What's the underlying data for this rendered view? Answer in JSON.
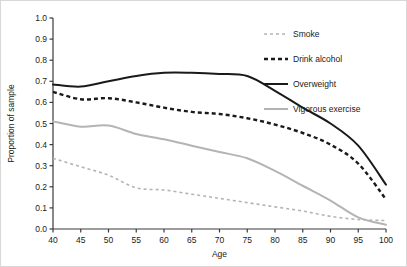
{
  "chart_data": {
    "type": "line",
    "title": "",
    "xlabel": "Age",
    "ylabel": "Proportion of sample",
    "xlim": [
      40,
      100
    ],
    "ylim": [
      0.0,
      1.0
    ],
    "grid": false,
    "legend_position": "right",
    "x": [
      40,
      45,
      50,
      55,
      60,
      65,
      70,
      75,
      80,
      85,
      90,
      95,
      100
    ],
    "xticks": [
      "40",
      "45",
      "50",
      "55",
      "60",
      "65",
      "70",
      "75",
      "80",
      "85",
      "90",
      "95",
      "100"
    ],
    "yticks": [
      "0.0",
      "0.1",
      "0.2",
      "0.3",
      "0.4",
      "0.5",
      "0.6",
      "0.7",
      "0.8",
      "0.9",
      "1.0"
    ],
    "series": [
      {
        "name": "Smoke",
        "color": "#b4b4b4",
        "style": "dashed",
        "width": 1.6,
        "values": [
          0.335,
          0.295,
          0.255,
          0.195,
          0.185,
          0.165,
          0.145,
          0.125,
          0.105,
          0.085,
          0.06,
          0.045,
          0.04
        ]
      },
      {
        "name": "Drink alcohol",
        "color": "#1a1a1a",
        "style": "dashed-bold",
        "width": 2.4,
        "values": [
          0.65,
          0.615,
          0.62,
          0.6,
          0.575,
          0.555,
          0.545,
          0.525,
          0.495,
          0.455,
          0.4,
          0.31,
          0.14
        ]
      },
      {
        "name": "Overweight",
        "color": "#1a1a1a",
        "style": "solid",
        "width": 2.0,
        "values": [
          0.685,
          0.675,
          0.7,
          0.725,
          0.74,
          0.74,
          0.735,
          0.725,
          0.655,
          0.575,
          0.5,
          0.395,
          0.21
        ]
      },
      {
        "name": "Vigorous exercise",
        "color": "#b4b4b4",
        "style": "solid",
        "width": 2.0,
        "values": [
          0.51,
          0.485,
          0.49,
          0.45,
          0.425,
          0.395,
          0.365,
          0.335,
          0.275,
          0.205,
          0.135,
          0.055,
          0.02
        ]
      }
    ]
  },
  "legend": {
    "items": [
      {
        "label": "Smoke"
      },
      {
        "label": "Drink alcohol"
      },
      {
        "label": "Overweight"
      },
      {
        "label": "Vigorous exercise"
      }
    ]
  },
  "axes": {
    "x_title": "Age",
    "y_title": "Proportion of sample"
  }
}
